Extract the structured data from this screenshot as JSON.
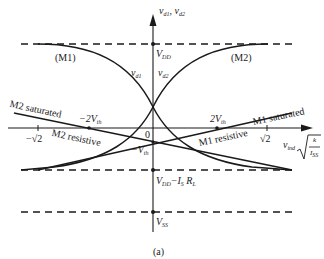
{
  "figure": {
    "caption": "(a)",
    "y_axis_label": "v_d1, v_d2",
    "x_axis_label": "v_ind sqrt(k / I_SS)",
    "origin_label": "0",
    "levels": {
      "vdd": "V_DD",
      "vdd_minus_isrl": "V_DD − I_S R_L",
      "vss": "V_SS"
    },
    "curve_labels": {
      "m1": "(M1)",
      "m2": "(M2)",
      "vd1": "v_d1",
      "vd2": "v_d2"
    },
    "region_labels": {
      "m2_saturated": "M2 saturated",
      "m2_resistive": "M2 resistive",
      "m1_saturated": "M1 saturated",
      "m1_resistive": "M1 resistive"
    },
    "tick_labels": {
      "neg_sqrt2": "−√2",
      "pos_sqrt2": "√2",
      "neg_2vth": "−2V_th",
      "pos_2vth": "2V_th",
      "neg_vth": "−V_th"
    },
    "colors": {
      "ink": "#1a1a1a",
      "background": "#ffffff"
    }
  },
  "labels": {
    "vdd_main": "V",
    "vdd_sub": "DD",
    "vss_main": "V",
    "vss_sub": "SS",
    "vddisrl_main": "V",
    "vddisrl_sub": "DD",
    "vddisrl_rest": "−I",
    "vddisrl_sub2": "S",
    "vddisrl_r": " R",
    "vddisrl_sub3": "L",
    "yaxis_v1": "v",
    "yaxis_sub1": "d1",
    "yaxis_comma": ", v",
    "yaxis_sub2": "d2",
    "vd1_v": "v",
    "vd1_sub": "d1",
    "vd2_v": "v",
    "vd2_sub": "d2",
    "m1": "(M1)",
    "m2": "(M2)",
    "zero": "0",
    "neg_sqrt2": "−√2",
    "pos_sqrt2": "√2",
    "neg2vth_main": "−2V",
    "neg2vth_sub": "th",
    "pos2vth_main": "2V",
    "pos2vth_sub": "th",
    "negvth_main": "−V",
    "negvth_sub": "th",
    "m2_saturated": "M2 saturated",
    "m2_resistive": "M2 resistive",
    "m1_saturated": "M1 saturated",
    "m1_resistive": "M1 resistive",
    "xaxis_v": "v",
    "xaxis_sub": "ind",
    "xaxis_k": "k",
    "xaxis_i": "I",
    "xaxis_isub": "SS",
    "caption": "(a)"
  }
}
